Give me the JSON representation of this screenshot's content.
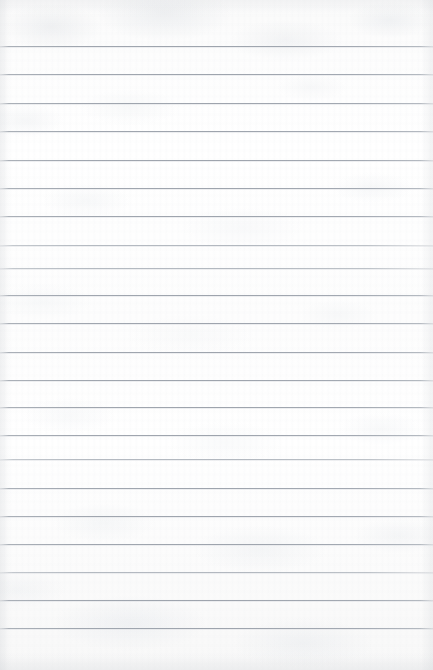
{
  "document": {
    "kind": "lined-notebook-paper",
    "title": "Blank ruled paper sheet",
    "content_text": "",
    "width_px": 433,
    "height_px": 670,
    "colors": {
      "paper": "#fdfdfd",
      "paper_shadow": "#f2f3f5",
      "rule_line": "#a0a6af",
      "edge_vignette": "#cdd0d4"
    },
    "ruling": {
      "line_count": 22,
      "first_line_y": 46,
      "last_line_y": 628,
      "spacing_px": 28.5,
      "top_margin_px": 46,
      "bottom_margin_px": 42,
      "left_margin_px": 0,
      "right_margin_px": 0,
      "has_vertical_margin_rule": false,
      "line_positions_y": [
        46,
        74,
        103,
        131,
        160,
        188,
        216,
        245,
        268,
        295,
        323,
        352,
        380,
        407,
        435,
        459,
        488,
        516,
        544,
        572,
        600,
        628
      ],
      "soft_line_indices": [
        7,
        8,
        15,
        19
      ]
    }
  }
}
